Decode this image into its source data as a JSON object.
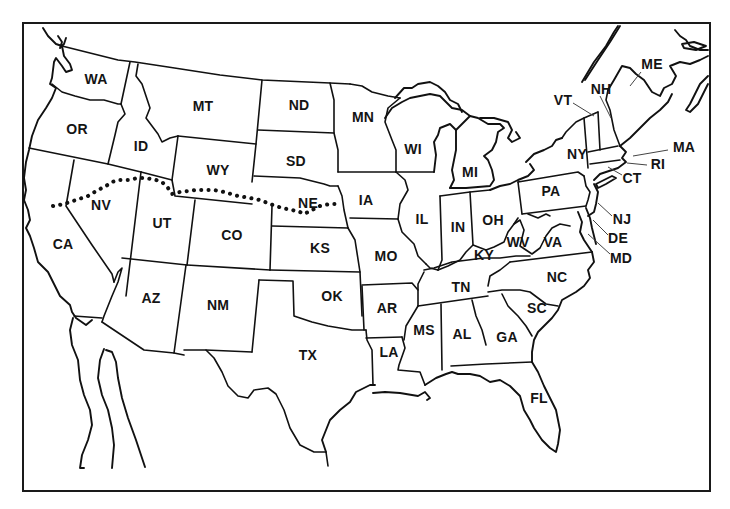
{
  "map": {
    "title": "",
    "frame_color": "#1a1a1a",
    "line_color": "#111111",
    "background": "#ffffff",
    "route": {
      "style": "dotted",
      "description": "dotted route line crossing CA, NV, UT, WY, NE to IA border"
    },
    "states": [
      {
        "abbr": "WA",
        "x": 96,
        "y": 79
      },
      {
        "abbr": "OR",
        "x": 77,
        "y": 129
      },
      {
        "abbr": "ID",
        "x": 141,
        "y": 146
      },
      {
        "abbr": "MT",
        "x": 203,
        "y": 106
      },
      {
        "abbr": "ND",
        "x": 299,
        "y": 105
      },
      {
        "abbr": "MN",
        "x": 363,
        "y": 117
      },
      {
        "abbr": "WY",
        "x": 218,
        "y": 170
      },
      {
        "abbr": "SD",
        "x": 296,
        "y": 161
      },
      {
        "abbr": "NV",
        "x": 101,
        "y": 205
      },
      {
        "abbr": "UT",
        "x": 162,
        "y": 223
      },
      {
        "abbr": "CO",
        "x": 232,
        "y": 235
      },
      {
        "abbr": "NE",
        "x": 308,
        "y": 203
      },
      {
        "abbr": "IA",
        "x": 366,
        "y": 200
      },
      {
        "abbr": "CA",
        "x": 63,
        "y": 244
      },
      {
        "abbr": "KS",
        "x": 320,
        "y": 248
      },
      {
        "abbr": "MO",
        "x": 386,
        "y": 256
      },
      {
        "abbr": "IL",
        "x": 422,
        "y": 219
      },
      {
        "abbr": "IN",
        "x": 458,
        "y": 227
      },
      {
        "abbr": "OH",
        "x": 493,
        "y": 220
      },
      {
        "abbr": "KY",
        "x": 484,
        "y": 255
      },
      {
        "abbr": "WV",
        "x": 518,
        "y": 242
      },
      {
        "abbr": "VA",
        "x": 553,
        "y": 242
      },
      {
        "abbr": "WI",
        "x": 413,
        "y": 149
      },
      {
        "abbr": "MI",
        "x": 470,
        "y": 172
      },
      {
        "abbr": "PA",
        "x": 551,
        "y": 191
      },
      {
        "abbr": "NY",
        "x": 577,
        "y": 154
      },
      {
        "abbr": "VT",
        "x": 563,
        "y": 100
      },
      {
        "abbr": "NH",
        "x": 601,
        "y": 89
      },
      {
        "abbr": "ME",
        "x": 652,
        "y": 64
      },
      {
        "abbr": "MA",
        "x": 684,
        "y": 147
      },
      {
        "abbr": "RI",
        "x": 658,
        "y": 164
      },
      {
        "abbr": "CT",
        "x": 632,
        "y": 178
      },
      {
        "abbr": "NJ",
        "x": 622,
        "y": 219
      },
      {
        "abbr": "DE",
        "x": 618,
        "y": 238
      },
      {
        "abbr": "MD",
        "x": 621,
        "y": 258
      },
      {
        "abbr": "NC",
        "x": 557,
        "y": 277
      },
      {
        "abbr": "TN",
        "x": 461,
        "y": 287
      },
      {
        "abbr": "SC",
        "x": 537,
        "y": 308
      },
      {
        "abbr": "AR",
        "x": 387,
        "y": 308
      },
      {
        "abbr": "OK",
        "x": 332,
        "y": 296
      },
      {
        "abbr": "AZ",
        "x": 151,
        "y": 298
      },
      {
        "abbr": "NM",
        "x": 218,
        "y": 305
      },
      {
        "abbr": "MS",
        "x": 424,
        "y": 330
      },
      {
        "abbr": "AL",
        "x": 462,
        "y": 334
      },
      {
        "abbr": "GA",
        "x": 507,
        "y": 337
      },
      {
        "abbr": "LA",
        "x": 389,
        "y": 352
      },
      {
        "abbr": "TX",
        "x": 308,
        "y": 355
      },
      {
        "abbr": "FL",
        "x": 539,
        "y": 398
      }
    ]
  }
}
